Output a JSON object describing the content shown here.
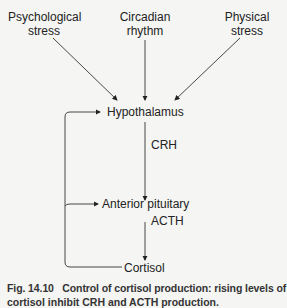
{
  "inputs": {
    "psychological": [
      "Psychological",
      "stress"
    ],
    "circadian": [
      "Circadian",
      "rhythm"
    ],
    "physical": [
      "Physical",
      "stress"
    ]
  },
  "nodes": {
    "hypothalamus": "Hypothalamus",
    "crh": "CRH",
    "anterior_pituitary": "Anterior pituitary",
    "acth": "ACTH",
    "cortisol": "Cortisol"
  },
  "caption": {
    "label": "Fig. 14.10",
    "text": "Control of cortisol production: rising levels of",
    "line2": "cortisol inhibit CRH and ACTH production."
  }
}
